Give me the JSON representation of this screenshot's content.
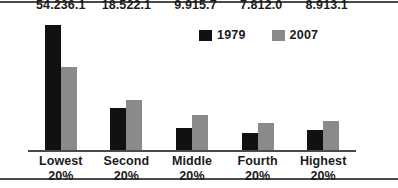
{
  "chart_data": {
    "type": "bar",
    "title": "",
    "subtitle": "",
    "xlabel": "",
    "ylabel": "",
    "ylim": [
      0,
      60
    ],
    "grid": false,
    "legend_position": "top-center-right",
    "categories": [
      "Lowest 20%",
      "Second 20%",
      "Middle 20%",
      "Fourth 20%",
      "Highest 20%"
    ],
    "category_lines": [
      [
        "Lowest",
        "20%"
      ],
      [
        "Second",
        "20%"
      ],
      [
        "Middle",
        "20%"
      ],
      [
        "Fourth",
        "20%"
      ],
      [
        "Highest",
        "20%"
      ]
    ],
    "series": [
      {
        "name": "1979",
        "color": "#111111",
        "values": [
          54.2,
          18.5,
          9.9,
          7.8,
          8.9
        ],
        "labels": [
          "54.2",
          "18.5",
          "9.9",
          "7.8",
          "8.9"
        ]
      },
      {
        "name": "2007",
        "color": "#8a8a8a",
        "values": [
          36.1,
          22.1,
          15.7,
          12.0,
          13.1
        ],
        "labels": [
          "36.1",
          "22.1",
          "15.7",
          "12.0",
          "13.1"
        ]
      }
    ]
  },
  "colors": {
    "series_1979": "#111111",
    "series_2007": "#8a8a8a",
    "axis": "#4a4a4a",
    "rule": "#4a4a4a",
    "text": "#1b1b1b",
    "background": "#ffffff"
  }
}
